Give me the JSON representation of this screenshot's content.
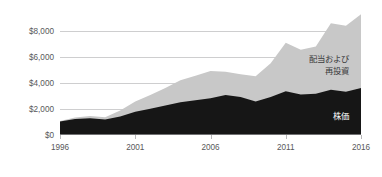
{
  "chart_data": {
    "type": "area",
    "stacked": true,
    "title": "",
    "subtitle": "",
    "xlabel": "",
    "ylabel": "",
    "xlim": [
      1996,
      2016
    ],
    "ylim": [
      0,
      10000
    ],
    "grid": true,
    "legend_position": "inline-annotation",
    "x": [
      1996,
      1997,
      1998,
      1999,
      2000,
      2001,
      2002,
      2003,
      2004,
      2005,
      2006,
      2007,
      2008,
      2009,
      2010,
      2011,
      2012,
      2013,
      2014,
      2015,
      2016
    ],
    "xticks": [
      1996,
      2001,
      2006,
      2011,
      2016
    ],
    "xtick_labels": [
      "1996",
      "2001",
      "2006",
      "2011",
      "2016"
    ],
    "yticks": [
      0,
      2000,
      4000,
      6000,
      8000
    ],
    "ytick_labels": [
      "$0",
      "$2,000",
      "$4,000",
      "$6,000",
      "$8,000"
    ],
    "series": [
      {
        "name": "株価",
        "label": "株価",
        "color": "#161616",
        "label_color": "#ffffff",
        "values": [
          1000,
          1200,
          1250,
          1150,
          1400,
          1750,
          2000,
          2250,
          2500,
          2650,
          2800,
          3050,
          2900,
          2550,
          2900,
          3350,
          3100,
          3150,
          3450,
          3300,
          3600
        ]
      },
      {
        "name": "配当および再投資",
        "label_line1": "配当および",
        "label_line2": "再投資",
        "color": "#c8c8c8",
        "label_color": "#3a3a3c",
        "values": [
          50,
          120,
          180,
          180,
          450,
          800,
          1050,
          1350,
          1700,
          1900,
          2100,
          1800,
          1750,
          1950,
          2600,
          3750,
          3450,
          3650,
          5150,
          5100,
          5700
        ]
      }
    ],
    "totals": [
      1050,
      1320,
      1430,
      1330,
      1850,
      2550,
      3050,
      3600,
      4200,
      4550,
      4900,
      4850,
      4650,
      4500,
      5500,
      7100,
      6550,
      6800,
      8600,
      8400,
      9300
    ],
    "annotations": [
      {
        "text_line1": "配当および",
        "text_line2": "再投資",
        "series": "配当および再投資"
      },
      {
        "text": "株価",
        "series": "株価"
      }
    ],
    "colors": {
      "stock_price": "#161616",
      "dividends": "#c8c8c8",
      "gridline": "#b9b9bb",
      "axis": "#6e6e70",
      "tick_text": "#58585a",
      "background": "#ffffff"
    }
  }
}
